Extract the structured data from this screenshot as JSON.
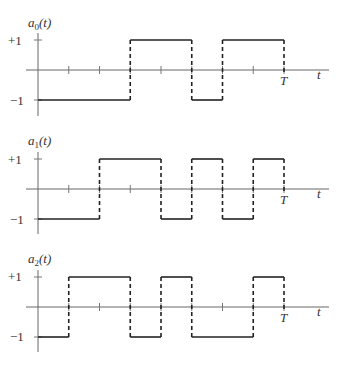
{
  "chart_data": [
    {
      "type": "line",
      "title": "",
      "ylabel": "a",
      "ylabel_subscript": "0",
      "ylabel_arg": "(t)",
      "xlabel": "t",
      "x_end_label": "T",
      "ytick_labels": [
        "+1",
        "−1"
      ],
      "ylim": [
        -1,
        1
      ],
      "xlim": [
        0,
        1
      ],
      "x_ticks_fraction_of_T": [
        0.125,
        0.25,
        0.375,
        0.5,
        0.625,
        0.75,
        0.875,
        1.0
      ],
      "segments": [
        {
          "from": 0,
          "to": 0.375,
          "value": -1
        },
        {
          "from": 0.375,
          "to": 0.625,
          "value": 1
        },
        {
          "from": 0.625,
          "to": 0.75,
          "value": -1
        },
        {
          "from": 0.75,
          "to": 1.0,
          "value": 1
        }
      ]
    },
    {
      "type": "line",
      "title": "",
      "ylabel": "a",
      "ylabel_subscript": "1",
      "ylabel_arg": "(t)",
      "xlabel": "t",
      "x_end_label": "T",
      "ytick_labels": [
        "+1",
        "−1"
      ],
      "ylim": [
        -1,
        1
      ],
      "xlim": [
        0,
        1
      ],
      "x_ticks_fraction_of_T": [
        0.125,
        0.25,
        0.375,
        0.5,
        0.625,
        0.75,
        0.875,
        1.0
      ],
      "segments": [
        {
          "from": 0,
          "to": 0.25,
          "value": -1
        },
        {
          "from": 0.25,
          "to": 0.5,
          "value": 1
        },
        {
          "from": 0.5,
          "to": 0.625,
          "value": -1
        },
        {
          "from": 0.625,
          "to": 0.75,
          "value": 1
        },
        {
          "from": 0.75,
          "to": 0.875,
          "value": -1
        },
        {
          "from": 0.875,
          "to": 1.0,
          "value": 1
        }
      ]
    },
    {
      "type": "line",
      "title": "",
      "ylabel": "a",
      "ylabel_subscript": "2",
      "ylabel_arg": "(t)",
      "xlabel": "t",
      "x_end_label": "T",
      "ytick_labels": [
        "+1",
        "−1"
      ],
      "ylim": [
        -1,
        1
      ],
      "xlim": [
        0,
        1
      ],
      "x_ticks_fraction_of_T": [
        0.125,
        0.25,
        0.375,
        0.5,
        0.625,
        0.75,
        0.875,
        1.0
      ],
      "segments": [
        {
          "from": 0,
          "to": 0.125,
          "value": -1
        },
        {
          "from": 0.125,
          "to": 0.375,
          "value": 1
        },
        {
          "from": 0.375,
          "to": 0.5,
          "value": -1
        },
        {
          "from": 0.5,
          "to": 0.625,
          "value": 1
        },
        {
          "from": 0.625,
          "to": 0.875,
          "value": -1
        },
        {
          "from": 0.875,
          "to": 1.0,
          "value": 1
        }
      ]
    }
  ],
  "labels": {
    "plot0": {
      "name": "a",
      "sub": "0",
      "arg": "(t)",
      "plus": "+1",
      "minus": "−1",
      "T": "T",
      "t": "t"
    },
    "plot1": {
      "name": "a",
      "sub": "1",
      "arg": "(t)",
      "plus": "+1",
      "minus": "−1",
      "T": "T",
      "t": "t"
    },
    "plot2": {
      "name": "a",
      "sub": "2",
      "arg": "(t)",
      "plus": "+1",
      "minus": "−1",
      "T": "T",
      "t": "t"
    }
  },
  "colors": {
    "waveform": "#222222",
    "axis": "#666666",
    "background": "#ffffff"
  }
}
